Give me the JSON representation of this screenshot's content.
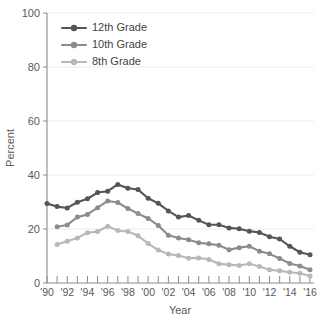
{
  "chart_data": {
    "type": "line",
    "title": "",
    "xlabel": "Year",
    "ylabel": "Percent",
    "ylim": [
      0,
      100
    ],
    "yticks": [
      0,
      20,
      40,
      60,
      80,
      100
    ],
    "xlim": [
      1990,
      2016
    ],
    "xtick_labels": [
      "'90",
      "'92",
      "'94",
      "'96",
      "'98",
      "'00",
      "'02",
      "'04",
      "'06",
      "'08",
      "'10",
      "'12",
      "'14",
      "'16"
    ],
    "xtick_years": [
      1990,
      1992,
      1994,
      1996,
      1998,
      2000,
      2002,
      2004,
      2006,
      2008,
      2010,
      2012,
      2014,
      2016
    ],
    "minor_xtick_years": [
      1991,
      1993,
      1995,
      1997,
      1999,
      2001,
      2003,
      2005,
      2007,
      2009,
      2011,
      2013,
      2015
    ],
    "grid": "horizontal",
    "legend_position": "upper-left",
    "x": [
      1990,
      1991,
      1992,
      1993,
      1994,
      1995,
      1996,
      1997,
      1998,
      1999,
      2000,
      2001,
      2002,
      2003,
      2004,
      2005,
      2006,
      2007,
      2008,
      2009,
      2010,
      2011,
      2012,
      2013,
      2014,
      2015,
      2016
    ],
    "series": [
      {
        "name": "12th Grade",
        "color": "#555555",
        "x": [
          1990,
          1991,
          1992,
          1993,
          1994,
          1995,
          1996,
          1997,
          1998,
          1999,
          2000,
          2001,
          2002,
          2003,
          2004,
          2005,
          2006,
          2007,
          2008,
          2009,
          2010,
          2011,
          2012,
          2013,
          2014,
          2015,
          2016
        ],
        "values": [
          29.4,
          28.3,
          27.8,
          29.9,
          31.2,
          33.5,
          34.0,
          36.5,
          35.1,
          34.6,
          31.4,
          29.5,
          26.7,
          24.4,
          25.0,
          23.2,
          21.6,
          21.6,
          20.4,
          20.1,
          19.2,
          18.7,
          17.1,
          16.3,
          13.6,
          11.4,
          10.5
        ]
      },
      {
        "name": "10th Grade",
        "color": "#8c8c8c",
        "x": [
          1991,
          1992,
          1993,
          1994,
          1995,
          1996,
          1997,
          1998,
          1999,
          2000,
          2001,
          2002,
          2003,
          2004,
          2005,
          2006,
          2007,
          2008,
          2009,
          2010,
          2011,
          2012,
          2013,
          2014,
          2015,
          2016
        ],
        "values": [
          20.8,
          21.5,
          24.4,
          25.4,
          27.9,
          30.4,
          29.8,
          27.6,
          25.7,
          23.9,
          21.3,
          17.7,
          16.7,
          16.0,
          14.9,
          14.5,
          14.0,
          12.3,
          13.1,
          13.6,
          11.8,
          10.8,
          9.1,
          7.2,
          6.3,
          4.9
        ]
      },
      {
        "name": "8th Grade",
        "color": "#b8b8b8",
        "x": [
          1991,
          1992,
          1993,
          1994,
          1995,
          1996,
          1997,
          1998,
          1999,
          2000,
          2001,
          2002,
          2003,
          2004,
          2005,
          2006,
          2007,
          2008,
          2009,
          2010,
          2011,
          2012,
          2013,
          2014,
          2015,
          2016
        ],
        "values": [
          14.3,
          15.5,
          16.7,
          18.6,
          19.1,
          21.0,
          19.4,
          19.1,
          17.5,
          14.6,
          12.2,
          10.7,
          10.2,
          9.2,
          9.3,
          8.7,
          7.1,
          6.8,
          6.5,
          7.1,
          6.1,
          4.9,
          4.5,
          4.0,
          3.6,
          2.6
        ]
      }
    ]
  },
  "legend": {
    "items": [
      {
        "label": "12th Grade"
      },
      {
        "label": "10th Grade"
      },
      {
        "label": "8th Grade"
      }
    ]
  }
}
